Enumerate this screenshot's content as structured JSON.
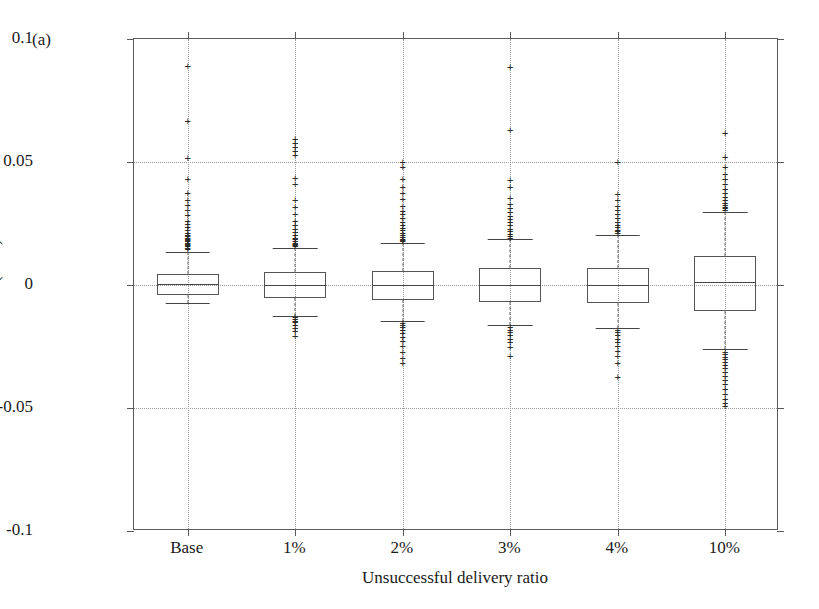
{
  "panel": {
    "label": "(a)"
  },
  "chart_data": {
    "type": "box",
    "title": "",
    "xlabel": "Unsuccessful delivery ratio",
    "ylabel": "Errors (MW)",
    "ylim": [
      -0.1,
      0.1
    ],
    "yticks": [
      0.1,
      0.05,
      0,
      -0.05,
      -0.1
    ],
    "ytick_labels": [
      "0.1",
      "0.05",
      "0",
      "-0.05",
      "-0.1"
    ],
    "grid": true,
    "grid_style": "dotted",
    "legend": "none",
    "categories": [
      "Base",
      "1%",
      "2%",
      "3%",
      "4%",
      "10%"
    ],
    "boxes": [
      {
        "category": "Base",
        "q1": -0.0042,
        "median": 0.0005,
        "q3": 0.0045,
        "whisker_low": -0.0075,
        "whisker_high": 0.0135,
        "outliers_high": [
          0.0145,
          0.0152,
          0.0158,
          0.0162,
          0.0168,
          0.0172,
          0.0178,
          0.0182,
          0.0188,
          0.0192,
          0.0198,
          0.0205,
          0.0212,
          0.0222,
          0.0235,
          0.0248,
          0.0262,
          0.0285,
          0.0305,
          0.0325,
          0.0345,
          0.0375,
          0.0432,
          0.0515,
          0.0668,
          0.0892
        ],
        "outliers_low": []
      },
      {
        "category": "1%",
        "q1": -0.0052,
        "median": 0.0002,
        "q3": 0.0052,
        "whisker_low": -0.0125,
        "whisker_high": 0.0152,
        "outliers_high": [
          0.0158,
          0.0162,
          0.0168,
          0.0172,
          0.0178,
          0.0185,
          0.0192,
          0.0205,
          0.0215,
          0.0228,
          0.0245,
          0.0262,
          0.0288,
          0.0318,
          0.0345,
          0.0412,
          0.0435,
          0.0528,
          0.0545,
          0.0562,
          0.0578,
          0.0592
        ],
        "outliers_low": [
          -0.0132,
          -0.0138,
          -0.0145,
          -0.0152,
          -0.0162,
          -0.0175,
          -0.0188,
          -0.0208
        ]
      },
      {
        "category": "2%",
        "q1": -0.0062,
        "median": -0.0002,
        "q3": 0.0058,
        "whisker_low": -0.0148,
        "whisker_high": 0.0172,
        "outliers_high": [
          0.0178,
          0.0182,
          0.0188,
          0.0195,
          0.0202,
          0.0212,
          0.0222,
          0.0232,
          0.0245,
          0.0258,
          0.0272,
          0.0288,
          0.0302,
          0.0322,
          0.0348,
          0.0372,
          0.0398,
          0.0432,
          0.0478,
          0.0498
        ],
        "outliers_low": [
          -0.0155,
          -0.0162,
          -0.0172,
          -0.0182,
          -0.0195,
          -0.0212,
          -0.0228,
          -0.0248,
          -0.0272,
          -0.0298,
          -0.0318
        ]
      },
      {
        "category": "3%",
        "q1": -0.0068,
        "median": 0.0002,
        "q3": 0.0068,
        "whisker_low": -0.0162,
        "whisker_high": 0.0185,
        "outliers_high": [
          0.0192,
          0.0198,
          0.0208,
          0.0218,
          0.0228,
          0.0242,
          0.0255,
          0.0268,
          0.0282,
          0.0298,
          0.0312,
          0.0328,
          0.0352,
          0.0398,
          0.0425,
          0.0632,
          0.0888
        ],
        "outliers_low": [
          -0.0172,
          -0.0182,
          -0.0192,
          -0.0205,
          -0.0218,
          -0.0232,
          -0.0252,
          -0.0288
        ]
      },
      {
        "category": "4%",
        "q1": -0.0072,
        "median": 0.0002,
        "q3": 0.0068,
        "whisker_low": -0.0175,
        "whisker_high": 0.0205,
        "outliers_high": [
          0.0212,
          0.0218,
          0.0225,
          0.0235,
          0.0245,
          0.0258,
          0.0272,
          0.0288,
          0.0305,
          0.0322,
          0.0345,
          0.0368,
          0.0498
        ],
        "outliers_low": [
          -0.0182,
          -0.0192,
          -0.0205,
          -0.0218,
          -0.0232,
          -0.0248,
          -0.0268,
          -0.0288,
          -0.0318,
          -0.0372
        ]
      },
      {
        "category": "10%",
        "q1": -0.0105,
        "median": 0.0012,
        "q3": 0.0118,
        "whisker_low": -0.0262,
        "whisker_high": 0.0298,
        "outliers_high": [
          0.0305,
          0.0312,
          0.0318,
          0.0325,
          0.0335,
          0.0345,
          0.0358,
          0.0372,
          0.0392,
          0.0412,
          0.0432,
          0.0452,
          0.0478,
          0.0522,
          0.0618
        ],
        "outliers_low": [
          -0.0272,
          -0.0282,
          -0.0292,
          -0.0302,
          -0.0312,
          -0.0325,
          -0.0338,
          -0.0352,
          -0.0368,
          -0.0385,
          -0.0402,
          -0.0422,
          -0.0442,
          -0.0462,
          -0.0478,
          -0.0492
        ]
      }
    ]
  },
  "style": {
    "outlier_marker": "+",
    "box_line_color": "#555555",
    "grid_color": "#9a9a9a",
    "axis_color": "#5a5a5a"
  }
}
